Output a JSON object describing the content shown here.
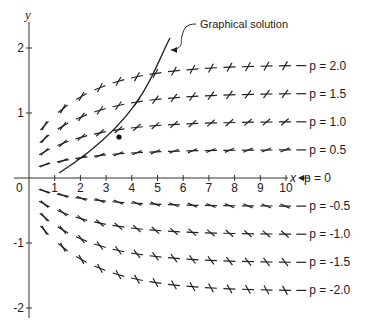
{
  "figure": {
    "y_axis_label": "y",
    "x_axis_label": "x",
    "origin_label": "0",
    "annotation": "Graphical solution",
    "x_ticks": [
      "1",
      "2",
      "3",
      "4",
      "5",
      "6",
      "7",
      "8",
      "9",
      "10"
    ],
    "y_ticks": [
      {
        "value": 2,
        "label": "2"
      },
      {
        "value": 1,
        "label": "1"
      },
      {
        "value": -1,
        "label": "-1"
      },
      {
        "value": -2,
        "label": "-2"
      }
    ],
    "isoclines": [
      {
        "p": 2.0,
        "label": "p = 2.0"
      },
      {
        "p": 1.5,
        "label": "p = 1.5"
      },
      {
        "p": 1.0,
        "label": "p = 1.0"
      },
      {
        "p": 0.5,
        "label": "p = 0.5"
      },
      {
        "p": 0,
        "label": "p = 0"
      },
      {
        "p": -0.5,
        "label": "p = -0.5"
      },
      {
        "p": -1.0,
        "label": "p = -1.0"
      },
      {
        "p": -1.5,
        "label": "p = -1.5"
      },
      {
        "p": -2.0,
        "label": "p = -2.0"
      }
    ],
    "stroke_color": "#222222"
  }
}
